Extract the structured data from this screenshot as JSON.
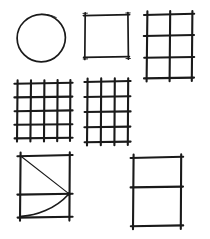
{
  "page": {
    "background_color": "#ffffff",
    "ink_color": "#1a1a1a",
    "width": 210,
    "height": 239,
    "style": "hand-drawn pen sketch, black ink on white paper, strokes overshoot at corners"
  },
  "figures": [
    {
      "id": "circle",
      "label": "Circle",
      "position": "top-left",
      "shape": "circle",
      "center_x": 41,
      "center_y": 38,
      "radius_x": 24,
      "radius_y": 24,
      "rows": 0,
      "columns": 0,
      "has_diagonal": false,
      "has_curve": false
    },
    {
      "id": "empty-square",
      "label": "Empty square",
      "position": "top-center",
      "shape": "square",
      "x": 85,
      "y": 15,
      "width": 43,
      "height": 42,
      "rows": 1,
      "columns": 1,
      "has_diagonal": false,
      "has_curve": false
    },
    {
      "id": "grid-2x3",
      "label": "Grid 2 columns by 3 rows",
      "position": "top-right",
      "shape": "grid",
      "x": 147,
      "y": 14,
      "width": 45,
      "height": 64,
      "rows": 3,
      "columns": 2,
      "has_diagonal": false,
      "has_curve": false
    },
    {
      "id": "grid-4x4",
      "label": "Grid 4 columns by 4 rows",
      "position": "middle-left",
      "shape": "grid",
      "x": 17,
      "y": 83,
      "width": 53,
      "height": 55,
      "rows": 4,
      "columns": 4,
      "has_diagonal": false,
      "has_curve": false
    },
    {
      "id": "grid-3x4",
      "label": "Grid 3 columns by 4 rows",
      "position": "middle-center",
      "shape": "grid",
      "x": 87,
      "y": 81,
      "width": 41,
      "height": 61,
      "rows": 4,
      "columns": 3,
      "has_diagonal": false,
      "has_curve": false
    },
    {
      "id": "square-diagonal-curve",
      "label": "Square with midline, diagonal and parabolic curve",
      "position": "bottom-left",
      "shape": "square-with-curve",
      "x": 20,
      "y": 155,
      "width": 50,
      "height": 62,
      "rows": 2,
      "columns": 1,
      "has_diagonal": true,
      "has_curve": true,
      "midline_y_fraction": 0.62,
      "diagonal_from": "top-left",
      "diagonal_to": "midline-right",
      "curve_from": "bottom-left",
      "curve_to": "midline-right"
    },
    {
      "id": "divided-rectangle",
      "label": "Tall rectangle divided into two rows",
      "position": "bottom-right",
      "shape": "rectangle",
      "x": 133,
      "y": 157,
      "width": 48,
      "height": 69,
      "rows": 2,
      "columns": 1,
      "has_diagonal": false,
      "has_curve": false,
      "midline_y_fraction": 0.43
    }
  ]
}
